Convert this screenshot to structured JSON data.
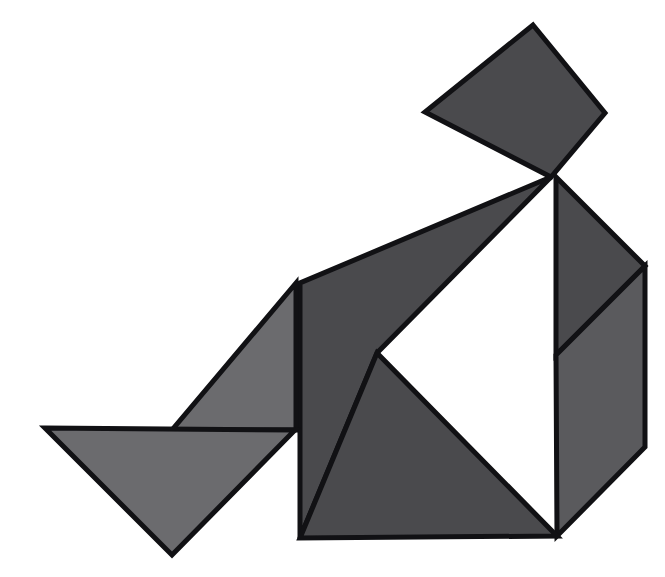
{
  "canvas": {
    "width": 665,
    "height": 577,
    "background_color": "#ffffff",
    "title": "Tangram figure"
  },
  "style": {
    "outline_color": "#111114",
    "outline_width": 5,
    "dark_fill": "#4a4a4d",
    "light_fill": "#6b6b6e",
    "mid_fill": "#5a5a5d"
  },
  "figure": {
    "name": "tangram-seated-figure",
    "piece_count": 7
  },
  "pieces": [
    {
      "id": "head-square",
      "name": "square",
      "shape": "square",
      "fill": "#4a4a4d",
      "tone": "dark",
      "points": "533,25 605,113 551,177 425,112"
    },
    {
      "id": "upper-large-triangle",
      "name": "large-triangle-upper",
      "shape": "triangle",
      "fill": "#4a4a4d",
      "tone": "dark",
      "points": "551,177 377,353 296,283 296,283"
    },
    {
      "id": "upper-large-triangle-body",
      "name": "large-triangle-body",
      "shape": "triangle",
      "fill": "#4a4a4d",
      "tone": "dark",
      "points": "551,177 377,353 300,538 300,283"
    },
    {
      "id": "right-upper-triangle",
      "name": "medium-triangle-right",
      "shape": "triangle",
      "fill": "#4a4a4d",
      "tone": "dark",
      "points": "556,177 645,266 556,355"
    },
    {
      "id": "right-parallelogram",
      "name": "parallelogram-right",
      "shape": "parallelogram",
      "fill": "#5a5a5d",
      "tone": "mid",
      "points": "556,355 645,266 645,447 557,536"
    },
    {
      "id": "bottom-right-triangle",
      "name": "large-triangle-lower",
      "shape": "triangle",
      "fill": "#4a4a4d",
      "tone": "dark",
      "points": "377,353 557,536 300,538"
    },
    {
      "id": "left-medium-triangle",
      "name": "medium-triangle-left",
      "shape": "triangle",
      "fill": "#6b6b6e",
      "tone": "light",
      "points": "296,283 296,430 172,430"
    },
    {
      "id": "bottom-left-triangle",
      "name": "small-triangle-lower-left",
      "shape": "triangle",
      "fill": "#6b6b6e",
      "tone": "light",
      "points": "45,428 295,430 172,555"
    }
  ],
  "labels": {
    "stage_label": "tangram-stage"
  }
}
